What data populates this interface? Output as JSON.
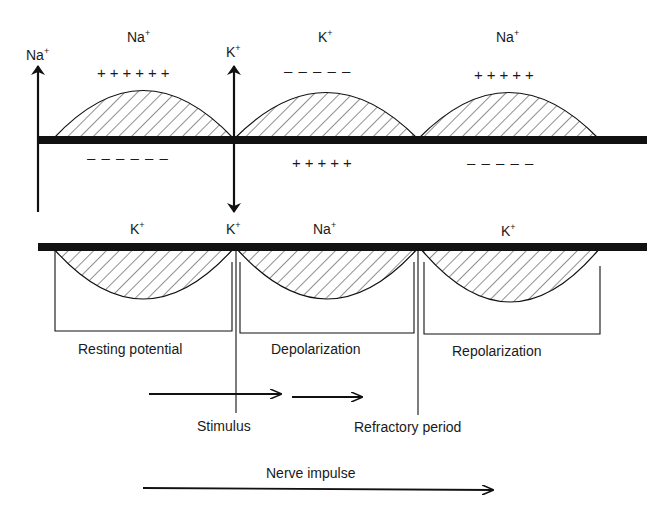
{
  "diagram": {
    "colors": {
      "ink": "#111111",
      "background": "#ffffff",
      "hatch": "#333333"
    },
    "top_labels": {
      "left_arrow": {
        "base": "Na",
        "sup": "+"
      },
      "segment1": {
        "base": "Na",
        "sup": "+"
      },
      "center_arrow": {
        "base": "K",
        "sup": "+"
      },
      "segment2": {
        "base": "K",
        "sup": "+"
      },
      "segment3": {
        "base": "Na",
        "sup": "+"
      }
    },
    "outside_charges": [
      "++++++",
      "– – – – –",
      "+++++"
    ],
    "inside_charges": [
      "– – – – – –",
      "+++++",
      "– – – – –"
    ],
    "lower_labels": {
      "segment1": {
        "base": "K",
        "sup": "+"
      },
      "center": {
        "base": "K",
        "sup": "+"
      },
      "segment2": {
        "base": "Na",
        "sup": "+"
      },
      "segment3": {
        "base": "K",
        "sup": "+"
      }
    },
    "phases": [
      "Resting potential",
      "Depolarization",
      "Repolarization"
    ],
    "markers": {
      "stimulus": "Stimulus",
      "refractory": "Refractory period"
    },
    "direction_label": "Nerve impulse"
  }
}
